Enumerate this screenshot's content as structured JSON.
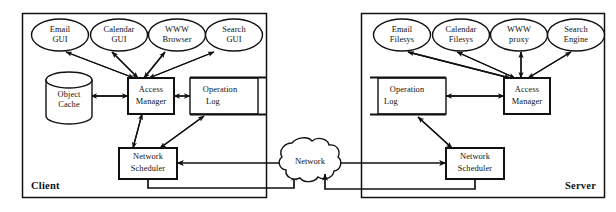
{
  "diagram": {
    "zones": [
      {
        "id": "client",
        "label": "Client",
        "label_align": "left"
      },
      {
        "id": "server",
        "label": "Server",
        "label_align": "right"
      }
    ],
    "network": {
      "label": "Network",
      "shape": "cloud"
    },
    "client": {
      "applications": [
        {
          "id": "email-gui",
          "line1": "Email",
          "line2": "GUI"
        },
        {
          "id": "calendar-gui",
          "line1": "Calendar",
          "line2": "GUI"
        },
        {
          "id": "www-browser",
          "line1": "WWW",
          "line2": "Browser"
        },
        {
          "id": "search-gui",
          "line1": "Search",
          "line2": "GUI"
        }
      ],
      "object_cache": {
        "line1": "Object",
        "line2": "Cache",
        "shape": "cylinder"
      },
      "access_manager": {
        "line1": "Access",
        "line2": "Manager",
        "shape": "box"
      },
      "operation_log": {
        "line1": "Operation",
        "line2": "Log",
        "shape": "log-box"
      },
      "network_scheduler": {
        "line1": "Network",
        "line2": "Scheduler",
        "shape": "box"
      }
    },
    "server": {
      "services": [
        {
          "id": "email-filesys",
          "line1": "Email",
          "line2": "Filesys"
        },
        {
          "id": "calendar-filesys",
          "line1": "Calendar",
          "line2": "Filesys"
        },
        {
          "id": "www-proxy",
          "line1": "WWW",
          "line2": "proxy"
        },
        {
          "id": "search-engine",
          "line1": "Search",
          "line2": "Engine"
        }
      ],
      "access_manager": {
        "line1": "Access",
        "line2": "Manager",
        "shape": "box"
      },
      "operation_log": {
        "line1": "Operation",
        "line2": "Log",
        "shape": "log-box"
      },
      "network_scheduler": {
        "line1": "Network",
        "line2": "Scheduler",
        "shape": "box"
      }
    },
    "colors": {
      "stroke": "#111111",
      "fill": "#ffffff",
      "background": "#ffffff"
    }
  }
}
